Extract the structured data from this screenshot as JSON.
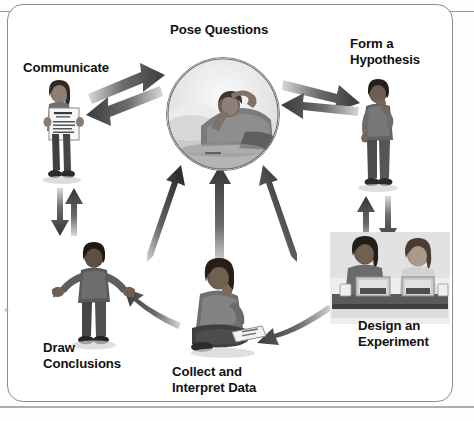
{
  "figure": {
    "frame_color": "#8d8d8d",
    "background_color": "#ffffff",
    "arrow_color": "#4a4a4a",
    "text_color": "#111111",
    "corner_tick": "✶"
  },
  "nodes": [
    {
      "id": "pose-questions",
      "label": "Pose Questions",
      "label_lines": "Pose Questions",
      "image_alt": "Student lying on cushions thinking, shown in a circular photo",
      "shape": "circle",
      "position": "center"
    },
    {
      "id": "form-a-hypothesis",
      "label": "Form a Hypothesis",
      "label_lines": "Form a\nHypothesis",
      "image_alt": "Boy standing with hand on chin",
      "shape": "cutout",
      "position": "top-right"
    },
    {
      "id": "design-an-experiment",
      "label": "Design an Experiment",
      "label_lines": "Design an\nExperiment",
      "image_alt": "Two students at a lab bench with trays and containers",
      "shape": "cutout",
      "position": "bottom-right"
    },
    {
      "id": "collect-and-interpret-data",
      "label": "Collect and Interpret Data",
      "label_lines": "Collect and\nInterpret Data",
      "image_alt": "Girl sitting cross-legged writing on a clipboard",
      "shape": "cutout",
      "position": "bottom-center"
    },
    {
      "id": "draw-conclusions",
      "label": "Draw Conclusions",
      "label_lines": "Draw\nConclusions",
      "image_alt": "Boy standing with arms open, shrugging",
      "shape": "cutout",
      "position": "bottom-left"
    },
    {
      "id": "communicate",
      "label": "Communicate",
      "label_lines": "Communicate",
      "image_alt": "Girl holding up a poster with a report",
      "shape": "cutout",
      "position": "top-left"
    }
  ],
  "arrows": [
    {
      "id": "communicate-to-pose",
      "from": "communicate",
      "to": "pose-questions",
      "direction": "one-way",
      "style": "block-3d"
    },
    {
      "id": "pose-to-communicate",
      "from": "pose-questions",
      "to": "communicate",
      "direction": "one-way",
      "style": "block-3d"
    },
    {
      "id": "pose-to-hypothesis",
      "from": "pose-questions",
      "to": "form-a-hypothesis",
      "direction": "one-way",
      "style": "block-3d"
    },
    {
      "id": "hypothesis-to-pose",
      "from": "form-a-hypothesis",
      "to": "pose-questions",
      "direction": "one-way",
      "style": "block-3d"
    },
    {
      "id": "hypothesis-to-design",
      "from": "form-a-hypothesis",
      "to": "design-an-experiment",
      "direction": "one-way",
      "style": "block-3d"
    },
    {
      "id": "design-to-hypothesis",
      "from": "design-an-experiment",
      "to": "form-a-hypothesis",
      "direction": "one-way",
      "style": "block-3d"
    },
    {
      "id": "design-to-collect",
      "from": "design-an-experiment",
      "to": "collect-and-interpret-data",
      "direction": "one-way",
      "style": "block-3d-curved"
    },
    {
      "id": "collect-to-draw",
      "from": "collect-and-interpret-data",
      "to": "draw-conclusions",
      "direction": "one-way",
      "style": "block-3d-curved"
    },
    {
      "id": "draw-to-communicate",
      "from": "draw-conclusions",
      "to": "communicate",
      "direction": "one-way",
      "style": "block-3d"
    },
    {
      "id": "communicate-to-draw",
      "from": "communicate",
      "to": "draw-conclusions",
      "direction": "one-way",
      "style": "block-3d"
    },
    {
      "id": "draw-inner-to-pose",
      "from": "draw-conclusions",
      "to": "pose-questions",
      "direction": "one-way",
      "style": "block-3d-inner"
    },
    {
      "id": "collect-inner-to-pose",
      "from": "collect-and-interpret-data",
      "to": "pose-questions",
      "direction": "one-way",
      "style": "block-3d-inner"
    },
    {
      "id": "design-inner-to-pose",
      "from": "design-an-experiment",
      "to": "pose-questions",
      "direction": "one-way",
      "style": "block-3d-inner"
    }
  ]
}
